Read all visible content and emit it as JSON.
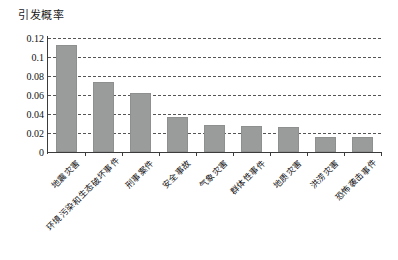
{
  "chart_data": {
    "type": "bar",
    "title": "",
    "ylabel": "引发概率",
    "xlabel": "",
    "ylim": [
      0,
      0.12
    ],
    "yticks": [
      "0",
      "0.02",
      "0.04",
      "0.06",
      "0.08",
      "0.1",
      "0.12"
    ],
    "ytick_values": [
      0,
      0.02,
      0.04,
      0.06,
      0.08,
      0.1,
      0.12
    ],
    "grid": true,
    "grid_style": "dashed-horizontal",
    "legend": null,
    "bar_color": "#9a9b9b",
    "categories": [
      "地震灾害",
      "环境污染和生态破坏事件",
      "刑事案件",
      "安全事故",
      "气象灾害",
      "群体性事件",
      "地质灾害",
      "洪涝灾害",
      "恐怖袭击事件"
    ],
    "values": [
      0.113,
      0.074,
      0.062,
      0.037,
      0.028,
      0.027,
      0.026,
      0.016,
      0.016
    ]
  },
  "axis": {
    "y_title": "引发概率"
  }
}
